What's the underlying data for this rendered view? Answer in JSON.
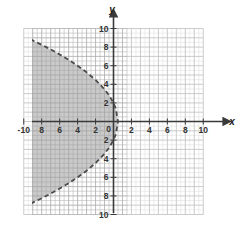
{
  "chart_data": {
    "type": "area",
    "title": "",
    "xlabel": "x",
    "ylabel": "y",
    "xlim": [
      -10,
      10
    ],
    "ylim": [
      -10,
      10
    ],
    "grid": true,
    "minor_grid_step": 0.5,
    "major_grid_step": 1,
    "legend": "none",
    "x_tick_labels": [
      "-10",
      "8",
      "6",
      "4",
      "2",
      "0",
      "2",
      "4",
      "6",
      "8",
      "10"
    ],
    "x_tick_values": [
      -10,
      -8,
      -6,
      -4,
      -2,
      0,
      2,
      4,
      6,
      8,
      10
    ],
    "y_tick_labels": [
      "10",
      "8",
      "6",
      "4",
      "2",
      "0",
      "2",
      "4",
      "6",
      "8",
      "10"
    ],
    "y_tick_values": [
      10,
      8,
      6,
      4,
      2,
      0,
      -2,
      -4,
      -6,
      -8,
      -10
    ],
    "series": [
      {
        "name": "boundary-parabola",
        "style": "dashed",
        "relation": "x = 0.5 - (y*y)/8",
        "vertex": [
          0.5,
          0
        ],
        "y_intercepts": [
          2,
          -2
        ],
        "points": [
          [
            -10.0,
            -9.17
          ],
          [
            -9.0,
            -8.72
          ],
          [
            -8.0,
            -8.25
          ],
          [
            -7.0,
            -7.75
          ],
          [
            -6.0,
            -7.21
          ],
          [
            -5.0,
            -6.63
          ],
          [
            -4.0,
            -6.0
          ],
          [
            -3.0,
            -5.29
          ],
          [
            -2.0,
            -4.47
          ],
          [
            -1.0,
            -3.46
          ],
          [
            -0.5,
            -2.83
          ],
          [
            0.0,
            -2.0
          ],
          [
            0.25,
            -1.41
          ],
          [
            0.5,
            0.0
          ],
          [
            0.25,
            1.41
          ],
          [
            0.0,
            2.0
          ],
          [
            -0.5,
            2.83
          ],
          [
            -1.0,
            3.46
          ],
          [
            -2.0,
            4.47
          ],
          [
            -3.0,
            5.29
          ],
          [
            -4.0,
            6.0
          ],
          [
            -5.0,
            6.63
          ],
          [
            -6.0,
            7.21
          ],
          [
            -7.0,
            7.75
          ],
          [
            -8.0,
            8.25
          ],
          [
            -9.0,
            8.72
          ],
          [
            -10.0,
            9.17
          ]
        ]
      }
    ],
    "shaded_region": {
      "description": "interior of leftward-opening parabola",
      "fill": "#a9a9a9",
      "boundary": "dashed-excluded"
    }
  },
  "colors": {
    "background": "#ffffff",
    "minor_grid": "#dcdcdc",
    "major_grid": "#bdbdbd",
    "axis": "#3a3a3a",
    "curve": "#4a4a4a",
    "shading": "#a9a9a9",
    "tick_label": "#333333"
  },
  "labels": {
    "x_axis_name": "x",
    "y_axis_name": "y",
    "origin": "0"
  }
}
